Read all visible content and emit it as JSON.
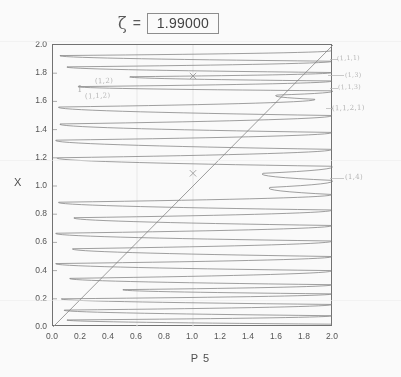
{
  "title": {
    "zeta_symbol": "ζ",
    "equals": "=",
    "value": "1.99000"
  },
  "axes": {
    "ylabel": "X",
    "xlabel": "P 5",
    "yticks": [
      "0.0",
      "0.2",
      "0.4",
      "0.6",
      "0.8",
      "1.0",
      "1.2",
      "1.4",
      "1.6",
      "1.8",
      "2.0"
    ],
    "xticks": [
      "0.0",
      "0.2",
      "0.4",
      "0.6",
      "0.8",
      "1.0",
      "1.2",
      "1.4",
      "1.6",
      "1.8",
      "2.0"
    ],
    "xlim": [
      0.0,
      2.0
    ],
    "ylim": [
      0.0,
      2.0
    ]
  },
  "annotations": {
    "left_bar": "I",
    "left_upper": "(1,2)",
    "left_lower": "(1,1,2)",
    "right_1": "(1,1,1)",
    "right_2": "(1,3)",
    "right_3": "(1,1,3)",
    "right_4": "(1,1,2,1)",
    "right_5": "(1,4)"
  },
  "chart_data": {
    "type": "line",
    "title": "ζ = 1.99000",
    "xlabel": "P 5",
    "ylabel": "X",
    "xlim": [
      0.0,
      2.0
    ],
    "ylim": [
      0.0,
      2.0
    ],
    "grid": false,
    "legend": null,
    "series": [
      {
        "name": "identity-line",
        "comment": "diagonal reference line y = x",
        "x": [
          0.0,
          2.0
        ],
        "y": [
          0.0,
          2.0
        ]
      },
      {
        "name": "P5-snaking-curve",
        "comment": "single continuous curve sweeping left-right across the box with sharp turnarounds; listed as successive turning points (x,y)",
        "turning_points": [
          [
            1.99,
            0.02
          ],
          [
            0.1,
            0.05
          ],
          [
            1.99,
            0.08
          ],
          [
            0.08,
            0.12
          ],
          [
            1.99,
            0.16
          ],
          [
            0.06,
            0.2
          ],
          [
            1.99,
            0.235
          ],
          [
            0.5,
            0.265
          ],
          [
            1.99,
            0.3
          ],
          [
            0.12,
            0.345
          ],
          [
            1.99,
            0.4
          ],
          [
            0.02,
            0.45
          ],
          [
            1.99,
            0.5
          ],
          [
            0.14,
            0.555
          ],
          [
            1.99,
            0.61
          ],
          [
            0.02,
            0.665
          ],
          [
            1.99,
            0.72
          ],
          [
            0.15,
            0.775
          ],
          [
            1.99,
            0.83
          ],
          [
            0.04,
            0.885
          ],
          [
            1.99,
            0.94
          ],
          [
            1.55,
            0.99
          ],
          [
            1.99,
            1.04
          ],
          [
            1.5,
            1.09
          ],
          [
            1.99,
            1.14
          ],
          [
            0.03,
            1.2
          ],
          [
            1.99,
            1.26
          ],
          [
            0.02,
            1.325
          ],
          [
            1.99,
            1.38
          ],
          [
            0.05,
            1.44
          ],
          [
            1.99,
            1.5
          ],
          [
            0.04,
            1.56
          ],
          [
            1.87,
            1.615
          ],
          [
            1.6,
            1.645
          ],
          [
            1.99,
            1.675
          ],
          [
            0.18,
            1.705
          ],
          [
            1.99,
            1.745
          ],
          [
            0.55,
            1.775
          ],
          [
            1.99,
            1.805
          ],
          [
            0.1,
            1.845
          ],
          [
            1.99,
            1.885
          ],
          [
            0.05,
            1.925
          ],
          [
            1.99,
            1.96
          ]
        ]
      }
    ],
    "markers": [
      {
        "name": "cursor-cross-upper",
        "x": 1.0,
        "y": 1.78,
        "symbol": "x"
      },
      {
        "name": "cursor-cross-lower",
        "x": 1.0,
        "y": 1.09,
        "symbol": "x"
      }
    ]
  }
}
